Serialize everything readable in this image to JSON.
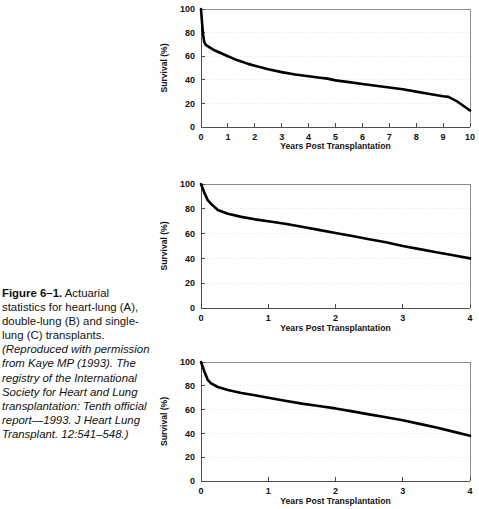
{
  "figure": {
    "label": "Figure 6–1.",
    "description": " Actuarial statistics for heart-lung (A), double-lung (B) and single-lung (C) transplants. ",
    "credit": "(Reproduced with permission from Kaye MP (1993). The registry of the International Society for Heart and Lung transplantation: Tenth official report—1993. J Heart Lung Transplant. 12:541–548.)"
  },
  "chart_data": [
    {
      "panel": "A",
      "type": "line",
      "title": "",
      "xlabel": "Years Post Transplantation",
      "ylabel": "Survival (%)",
      "xlim": [
        0,
        10
      ],
      "ylim": [
        0,
        100
      ],
      "xticks": [
        "0",
        "1",
        "2",
        "3",
        "4",
        "5",
        "6",
        "7",
        "8",
        "9",
        "10"
      ],
      "yticks": [
        "0",
        "20",
        "40",
        "60",
        "80",
        "100"
      ],
      "grid": true,
      "series": [
        {
          "name": "Heart-lung survival",
          "x": [
            0,
            0.04,
            0.08,
            0.12,
            0.18,
            0.25,
            0.35,
            0.5,
            0.75,
            1.0,
            1.25,
            1.5,
            1.75,
            2.0,
            2.5,
            3.0,
            3.5,
            4.0,
            4.5,
            4.7,
            5.0,
            5.5,
            6.0,
            6.5,
            7.0,
            7.5,
            8.0,
            8.5,
            9.0,
            9.2,
            9.5,
            10.0
          ],
          "y": [
            100,
            88,
            78,
            72,
            69.5,
            68.5,
            67,
            65,
            62.5,
            60,
            57.5,
            55.5,
            53.5,
            52,
            49,
            46.5,
            44.5,
            43,
            41.5,
            41,
            39.5,
            38,
            36.5,
            35,
            33.5,
            32,
            30,
            28,
            26,
            25.5,
            22,
            14
          ]
        }
      ]
    },
    {
      "panel": "B",
      "type": "line",
      "title": "",
      "xlabel": "Years Post Transplantation",
      "ylabel": "Survival (%)",
      "xlim": [
        0,
        4
      ],
      "ylim": [
        0,
        100
      ],
      "xticks": [
        "0",
        "1",
        "2",
        "3",
        "4"
      ],
      "yticks": [
        "0",
        "20",
        "40",
        "60",
        "80",
        "100"
      ],
      "grid": true,
      "series": [
        {
          "name": "Double-lung survival",
          "x": [
            0,
            0.05,
            0.1,
            0.15,
            0.25,
            0.4,
            0.6,
            0.8,
            1.0,
            1.25,
            1.5,
            1.75,
            2.0,
            2.25,
            2.5,
            2.75,
            3.0,
            3.25,
            3.5,
            3.75,
            4.0
          ],
          "y": [
            100,
            93,
            87,
            84,
            79,
            76,
            73.5,
            71.5,
            70,
            68,
            65.5,
            63,
            60.5,
            58,
            55.5,
            53,
            50,
            47.5,
            45,
            42.5,
            40
          ]
        }
      ]
    },
    {
      "panel": "C",
      "type": "line",
      "title": "",
      "xlabel": "Years Post Transplantation",
      "ylabel": "Survival (%)",
      "xlim": [
        0,
        4
      ],
      "ylim": [
        0,
        100
      ],
      "xticks": [
        "0",
        "1",
        "2",
        "3",
        "4"
      ],
      "yticks": [
        "0",
        "20",
        "40",
        "60",
        "80",
        "100"
      ],
      "grid": true,
      "series": [
        {
          "name": "Single-lung survival",
          "x": [
            0,
            0.05,
            0.1,
            0.15,
            0.25,
            0.4,
            0.6,
            0.8,
            1.0,
            1.25,
            1.5,
            1.75,
            2.0,
            2.25,
            2.5,
            2.75,
            3.0,
            3.25,
            3.5,
            3.75,
            4.0
          ],
          "y": [
            100,
            92,
            85,
            82,
            79,
            76.5,
            74,
            72,
            70,
            67.5,
            65,
            63,
            61,
            58.5,
            56,
            53.5,
            51,
            48,
            45,
            41.5,
            38
          ]
        }
      ]
    }
  ]
}
